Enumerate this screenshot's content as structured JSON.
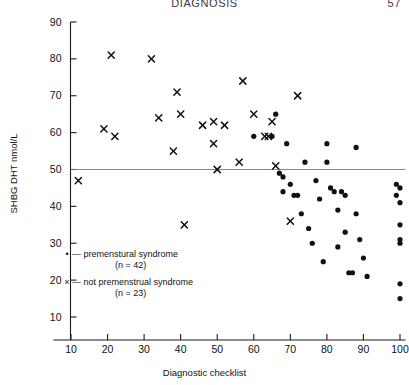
{
  "page": {
    "running_head": "DIAGNOSIS",
    "folio": "57"
  },
  "legend": {
    "dot_glyph": "•",
    "cross_glyph": "×",
    "dash": "—",
    "series1_label": "premenstural syndrome",
    "series1_count": "(n = 42)",
    "series2_label": "not premenstrual syndrome",
    "series2_count": "(n = 23)"
  },
  "chart_data": {
    "type": "scatter",
    "title": "",
    "xlabel": "Diagnostic checklist",
    "ylabel": "SHBG DHT nmol/L",
    "xlim": [
      0,
      103
    ],
    "ylim": [
      5,
      92
    ],
    "xticks": [
      10,
      20,
      30,
      40,
      50,
      60,
      70,
      80,
      90,
      100
    ],
    "yticks": [
      10,
      20,
      30,
      40,
      50,
      60,
      70,
      80,
      90
    ],
    "grid": false,
    "legend_position": "lower-left-inside",
    "annotations": [
      {
        "type": "hline",
        "y": 50,
        "label": "",
        "color": "#7a7a7a"
      }
    ],
    "series": [
      {
        "name": "premenstural syndrome",
        "count": 42,
        "marker": "circle",
        "color": "#111111",
        "points": [
          [
            60,
            59
          ],
          [
            65,
            59
          ],
          [
            66,
            65
          ],
          [
            67,
            49
          ],
          [
            68,
            48
          ],
          [
            68,
            44
          ],
          [
            69,
            57
          ],
          [
            70,
            46
          ],
          [
            71,
            43
          ],
          [
            72,
            43
          ],
          [
            73,
            38
          ],
          [
            74,
            52
          ],
          [
            75,
            34
          ],
          [
            76,
            30
          ],
          [
            77,
            47
          ],
          [
            78,
            42
          ],
          [
            79,
            25
          ],
          [
            80,
            57
          ],
          [
            80,
            52
          ],
          [
            81,
            45
          ],
          [
            82,
            44
          ],
          [
            83,
            29
          ],
          [
            83,
            39
          ],
          [
            84,
            44
          ],
          [
            85,
            43
          ],
          [
            85,
            33
          ],
          [
            86,
            22
          ],
          [
            87,
            22
          ],
          [
            88,
            56
          ],
          [
            88,
            38
          ],
          [
            89,
            31
          ],
          [
            90,
            26
          ],
          [
            91,
            21
          ],
          [
            99,
            46
          ],
          [
            99,
            43
          ],
          [
            100,
            45
          ],
          [
            100,
            41
          ],
          [
            100,
            35
          ],
          [
            100,
            31
          ],
          [
            100,
            30
          ],
          [
            100,
            19
          ],
          [
            100,
            15
          ]
        ]
      },
      {
        "name": "not premenstrual syndrome",
        "count": 23,
        "marker": "cross",
        "color": "#111111",
        "points": [
          [
            12,
            47
          ],
          [
            19,
            61
          ],
          [
            21,
            81
          ],
          [
            22,
            59
          ],
          [
            32,
            80
          ],
          [
            34,
            64
          ],
          [
            38,
            55
          ],
          [
            39,
            71
          ],
          [
            40,
            65
          ],
          [
            41,
            35
          ],
          [
            46,
            62
          ],
          [
            49,
            63
          ],
          [
            49,
            57
          ],
          [
            50,
            50
          ],
          [
            52,
            62
          ],
          [
            56,
            52
          ],
          [
            57,
            74
          ],
          [
            60,
            65
          ],
          [
            63,
            59
          ],
          [
            64,
            59
          ],
          [
            65,
            63
          ],
          [
            66,
            51
          ],
          [
            70,
            36
          ],
          [
            72,
            70
          ]
        ]
      }
    ]
  }
}
